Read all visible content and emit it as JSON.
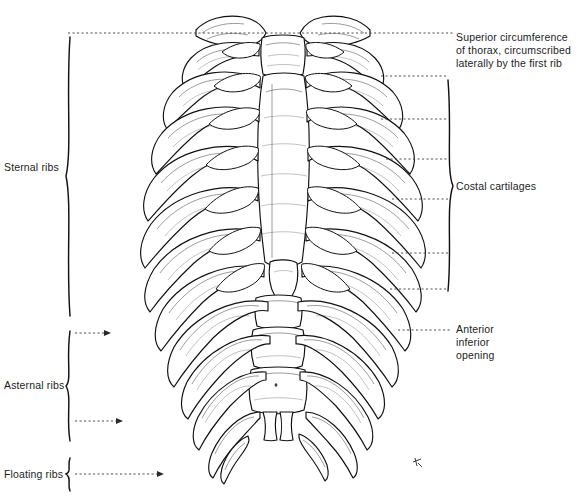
{
  "figure": {
    "width": 579,
    "height": 497,
    "background_color": "#ffffff",
    "ink_color": "#101010",
    "leader_color": "#3a3a3a"
  },
  "labels": {
    "right": [
      {
        "name": "superior-circumference",
        "text": "Superior circumference\nof thorax, circumscribed\nlaterally by the first rib",
        "x": 456,
        "y": 31
      },
      {
        "name": "costal-cartilages",
        "text": "Costal cartilages",
        "x": 456,
        "y": 180
      },
      {
        "name": "anterior-inferior-opening",
        "text": "Anterior\ninferior\nopening",
        "x": 456,
        "y": 323
      }
    ],
    "left": [
      {
        "name": "sternal-ribs",
        "text": "Sternal ribs",
        "x": 4,
        "y": 161
      },
      {
        "name": "asternal-ribs",
        "text": "Asternal ribs",
        "x": 4,
        "y": 379
      },
      {
        "name": "floating-ribs",
        "text": "Floating ribs",
        "x": 4,
        "y": 468
      }
    ]
  },
  "brackets": [
    {
      "name": "sternal-ribs-bracket",
      "side": "left",
      "x": 69,
      "y_top": 37,
      "y_bottom": 316
    },
    {
      "name": "asternal-ribs-bracket",
      "side": "left",
      "x": 69,
      "y_top": 331,
      "y_bottom": 441
    },
    {
      "name": "floating-ribs-bracket",
      "side": "left",
      "x": 69,
      "y_top": 458,
      "y_bottom": 491
    },
    {
      "name": "costal-cartilages-bracket",
      "side": "right",
      "x": 449,
      "y_top": 80,
      "y_bottom": 291
    }
  ],
  "leader_lines": [
    {
      "name": "leader-superior-circumference",
      "x1": 68,
      "x2": 453,
      "y": 33
    },
    {
      "name": "leader-cartilage-1",
      "x1": 381,
      "x2": 448,
      "y": 76
    },
    {
      "name": "leader-cartilage-2",
      "x1": 381,
      "x2": 448,
      "y": 119
    },
    {
      "name": "leader-cartilage-3",
      "x1": 386,
      "x2": 448,
      "y": 159
    },
    {
      "name": "leader-cartilage-4",
      "x1": 392,
      "x2": 448,
      "y": 199
    },
    {
      "name": "leader-cartilage-5",
      "x1": 392,
      "x2": 448,
      "y": 253
    },
    {
      "name": "leader-cartilage-6",
      "x1": 390,
      "x2": 448,
      "y": 289
    },
    {
      "name": "leader-anterior-inferior-opening",
      "x1": 398,
      "x2": 452,
      "y": 330
    },
    {
      "name": "leader-asternal-ribs",
      "x1": 75,
      "x2": 108,
      "y": 333
    },
    {
      "name": "leader-asternal-ribs-2",
      "x1": 75,
      "x2": 120,
      "y": 421
    },
    {
      "name": "leader-floating-ribs",
      "x1": 75,
      "x2": 160,
      "y": 474
    }
  ],
  "anatomy": {
    "structures": [
      "clavicle-left",
      "clavicle-right",
      "manubrium",
      "sternum-body",
      "xiphoid-process",
      "first-rib-pair",
      "ribs-1-through-12",
      "costal-cartilages",
      "lumbar-vertebrae",
      "thoracic-vertebrae"
    ],
    "rib_pair_count": 12,
    "sternal_rib_range": "1-7",
    "asternal_rib_range": "8-10",
    "floating_rib_range": "11-12"
  },
  "signature": {
    "name": "artist-signature-mark",
    "x": 418,
    "y": 462
  }
}
